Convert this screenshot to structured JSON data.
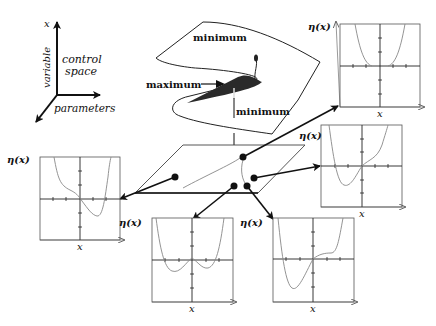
{
  "axes_legend": {
    "vertical_label": "x",
    "vertical_name": "variable",
    "horizontal_label": "control",
    "horizontal_label2": "space",
    "depth_label": "parameters"
  },
  "surface": {
    "top_label": "minimum",
    "fold_label": "maximum",
    "bottom_label": "minimum",
    "fold_color": "#2a2a2a"
  },
  "graphs": [
    {
      "id": "top-right",
      "ylabel": "η(x)",
      "xlabel": "x",
      "shape": "single-well-flat"
    },
    {
      "id": "right-middle",
      "ylabel": "η(x)",
      "xlabel": "x",
      "shape": "asymmetric-left-well"
    },
    {
      "id": "left",
      "ylabel": "η(x)",
      "xlabel": "x",
      "shape": "asymmetric-right-well"
    },
    {
      "id": "bottom-left",
      "ylabel": "η(x)",
      "xlabel": "x",
      "shape": "double-well"
    },
    {
      "id": "bottom-right",
      "ylabel": "η(x)",
      "xlabel": "x",
      "shape": "left-well-inflection"
    }
  ]
}
